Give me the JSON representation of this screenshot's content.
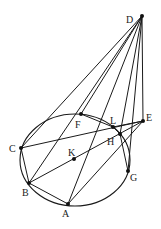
{
  "diagram": {
    "title": "",
    "circle": {
      "cx": 75,
      "cy": 160,
      "rx": 55,
      "ry": 46,
      "center_label": "K"
    },
    "points": [
      {
        "id": "D",
        "label": "D",
        "x": 142,
        "y": 16,
        "lx": 126,
        "ly": 23
      },
      {
        "id": "E",
        "label": "E",
        "x": 143,
        "y": 121,
        "lx": 146,
        "ly": 121
      },
      {
        "id": "F",
        "label": "F",
        "x": 81,
        "y": 114,
        "lx": 75,
        "ly": 128
      },
      {
        "id": "L",
        "label": "L",
        "x": 113,
        "y": 127,
        "lx": 110,
        "ly": 124
      },
      {
        "id": "H",
        "label": "H",
        "x": 120,
        "y": 134,
        "lx": 107,
        "ly": 145
      },
      {
        "id": "C",
        "label": "C",
        "x": 21,
        "y": 148,
        "lx": 9,
        "ly": 152
      },
      {
        "id": "K",
        "label": "K",
        "x": 74,
        "y": 159,
        "lx": 68,
        "ly": 156
      },
      {
        "id": "B",
        "label": "B",
        "x": 29,
        "y": 183,
        "lx": 22,
        "ly": 196
      },
      {
        "id": "G",
        "label": "G",
        "x": 128,
        "y": 171,
        "lx": 130,
        "ly": 181
      },
      {
        "id": "A",
        "label": "A",
        "x": 68,
        "y": 204,
        "lx": 62,
        "ly": 217
      }
    ],
    "segments": [
      [
        "D",
        "C"
      ],
      [
        "D",
        "F"
      ],
      [
        "D",
        "B"
      ],
      [
        "D",
        "A"
      ],
      [
        "D",
        "H"
      ],
      [
        "D",
        "G"
      ],
      [
        "D",
        "E"
      ],
      [
        "C",
        "E"
      ],
      [
        "B",
        "E"
      ],
      [
        "A",
        "E"
      ],
      [
        "L",
        "E"
      ],
      [
        "B",
        "A"
      ],
      [
        "C",
        "B"
      ],
      [
        "F",
        "L"
      ],
      [
        "L",
        "H"
      ],
      [
        "H",
        "G"
      ]
    ]
  }
}
